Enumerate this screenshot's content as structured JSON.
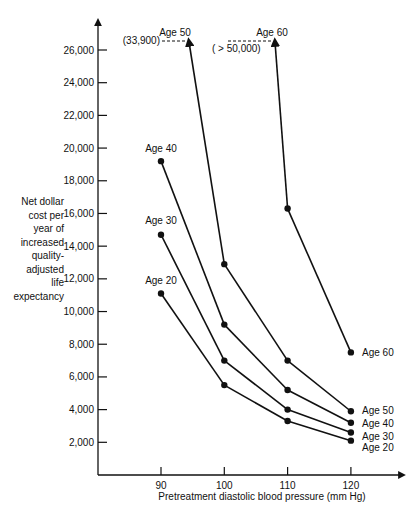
{
  "chart_data": {
    "type": "line",
    "title": "",
    "xlabel": "Pretreatment diastolic blood pressure (mm Hg)",
    "ylabel_lines": [
      "Net dollar",
      "cost per",
      "year of",
      "increased",
      "quality-",
      "adjusted",
      "life",
      "expectancy"
    ],
    "ylabel": "Net dollar cost per year of increased quality-adjusted life expectancy",
    "x": [
      90,
      100,
      110,
      120
    ],
    "xticks": [
      "90",
      "100",
      "110",
      "120"
    ],
    "yticks": [
      "2,000",
      "4,000",
      "6,000",
      "8,000",
      "10,000",
      "12,000",
      "14,000",
      "16,000",
      "18,000",
      "20,000",
      "22,000",
      "24,000",
      "26,000"
    ],
    "ytick_values": [
      2000,
      4000,
      6000,
      8000,
      10000,
      12000,
      14000,
      16000,
      18000,
      20000,
      22000,
      24000,
      26000
    ],
    "ylim": [
      0,
      28000
    ],
    "xlim": [
      80,
      127
    ],
    "grid": false,
    "legend": "inline labels",
    "series": [
      {
        "name": "Age 20",
        "x": [
          90,
          100,
          110,
          120
        ],
        "values": [
          11100,
          5500,
          3300,
          2100
        ]
      },
      {
        "name": "Age 30",
        "x": [
          90,
          100,
          110,
          120
        ],
        "values": [
          14700,
          7000,
          4000,
          2600
        ]
      },
      {
        "name": "Age 40",
        "x": [
          90,
          100,
          110,
          120
        ],
        "values": [
          19200,
          9200,
          5200,
          3200
        ]
      },
      {
        "name": "Age 50",
        "x": [
          90,
          100,
          110,
          120
        ],
        "values": [
          33900,
          12900,
          7000,
          3900
        ],
        "offscale_label": "(33,900)"
      },
      {
        "name": "Age 60",
        "x": [
          100,
          110,
          120
        ],
        "values": [
          50000,
          16300,
          7500
        ],
        "offscale_label": "( > 50,000)"
      }
    ],
    "annotations": [
      {
        "text": "(33,900)",
        "series": "Age 50"
      },
      {
        "text": "( > 50,000)",
        "series": "Age 60"
      }
    ]
  }
}
